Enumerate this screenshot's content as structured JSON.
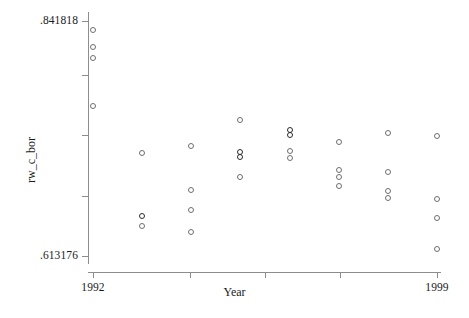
{
  "chart_data": {
    "type": "scatter",
    "title": "",
    "xlabel": "Year",
    "ylabel": "rw_c_bor",
    "xlim": [
      1992,
      1999
    ],
    "ylim": [
      0.613176,
      0.841818
    ],
    "grid": false,
    "legend": null,
    "x_tick_labels": [
      "1992",
      "1999"
    ],
    "x_tick_values": [
      1992,
      1999
    ],
    "y_tick_labels": [
      ".841818",
      ".613176"
    ],
    "y_tick_values": [
      0.841818,
      0.613176
    ],
    "marker_style": "open-circle",
    "series": [
      {
        "name": "rw_c_bor",
        "points": [
          {
            "x": 1992,
            "y": 0.8331,
            "dark": false
          },
          {
            "x": 1992,
            "y": 0.8167,
            "dark": false
          },
          {
            "x": 1992,
            "y": 0.8058,
            "dark": false
          },
          {
            "x": 1992,
            "y": 0.7594,
            "dark": false
          },
          {
            "x": 1993,
            "y": 0.713,
            "dark": false
          },
          {
            "x": 1993,
            "y": 0.6521,
            "dark": true
          },
          {
            "x": 1993,
            "y": 0.6421,
            "dark": false
          },
          {
            "x": 1994,
            "y": 0.7203,
            "dark": false
          },
          {
            "x": 1994,
            "y": 0.6775,
            "dark": false
          },
          {
            "x": 1994,
            "y": 0.6584,
            "dark": false
          },
          {
            "x": 1994,
            "y": 0.6366,
            "dark": false
          },
          {
            "x": 1995,
            "y": 0.7458,
            "dark": false
          },
          {
            "x": 1995,
            "y": 0.7148,
            "dark": true
          },
          {
            "x": 1995,
            "y": 0.7094,
            "dark": true
          },
          {
            "x": 1995,
            "y": 0.6903,
            "dark": false
          },
          {
            "x": 1996,
            "y": 0.7358,
            "dark": true
          },
          {
            "x": 1996,
            "y": 0.7312,
            "dark": true
          },
          {
            "x": 1996,
            "y": 0.7157,
            "dark": false
          },
          {
            "x": 1996,
            "y": 0.7085,
            "dark": false
          },
          {
            "x": 1997,
            "y": 0.7239,
            "dark": false
          },
          {
            "x": 1997,
            "y": 0.6966,
            "dark": false
          },
          {
            "x": 1997,
            "y": 0.6902,
            "dark": false
          },
          {
            "x": 1997,
            "y": 0.6812,
            "dark": false
          },
          {
            "x": 1998,
            "y": 0.733,
            "dark": false
          },
          {
            "x": 1998,
            "y": 0.6948,
            "dark": false
          },
          {
            "x": 1998,
            "y": 0.6766,
            "dark": false
          },
          {
            "x": 1998,
            "y": 0.6693,
            "dark": false
          },
          {
            "x": 1999,
            "y": 0.7303,
            "dark": false
          },
          {
            "x": 1999,
            "y": 0.6684,
            "dark": false
          },
          {
            "x": 1999,
            "y": 0.6502,
            "dark": false
          },
          {
            "x": 1999,
            "y": 0.6201,
            "dark": false
          }
        ]
      }
    ]
  },
  "axes": {
    "y_title": "rw_c_bor",
    "x_title": "Year",
    "y_top_label": ".841818",
    "y_bottom_label": ".613176",
    "x_left_label": "1992",
    "x_right_label": "1999"
  }
}
